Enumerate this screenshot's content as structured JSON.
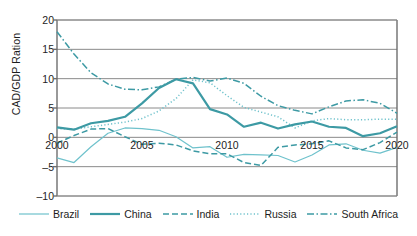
{
  "chart_data": {
    "type": "line",
    "title": "",
    "xlabel": "",
    "ylabel": "CAD/GDP Ration",
    "ylim": [
      -10,
      20
    ],
    "xlim": [
      2000,
      2020
    ],
    "yticks": [
      20,
      15,
      10,
      5,
      0,
      -5,
      -10
    ],
    "ytick_labels": [
      "20",
      "15",
      "10",
      "5",
      "0",
      "–5",
      "–10"
    ],
    "xticks": [
      2000,
      2005,
      2010,
      2015,
      2020
    ],
    "xtick_labels": [
      "2000",
      "2005",
      "2010",
      "2015",
      "2020"
    ],
    "grid": "horizontal",
    "legend_position": "bottom",
    "x": [
      2000,
      2001,
      2002,
      2003,
      2004,
      2005,
      2006,
      2007,
      2008,
      2009,
      2010,
      2011,
      2012,
      2013,
      2014,
      2015,
      2016,
      2017,
      2018,
      2019,
      2020
    ],
    "series": [
      {
        "name": "Brazil",
        "style": "solid-thin",
        "color": "#6fc2cc",
        "values": [
          -3.5,
          -4.3,
          -1.6,
          0.7,
          1.6,
          1.5,
          1.2,
          0.1,
          -1.8,
          -1.6,
          -3.4,
          -2.9,
          -3.0,
          -3.1,
          -4.2,
          -3.0,
          -1.3,
          -1.1,
          -2.2,
          -2.7,
          -1.7
        ]
      },
      {
        "name": "China",
        "style": "solid-thick",
        "color": "#3d9aa4",
        "values": [
          1.7,
          1.3,
          2.4,
          2.8,
          3.5,
          5.8,
          8.4,
          9.9,
          9.2,
          4.8,
          3.9,
          1.8,
          2.5,
          1.5,
          2.2,
          2.7,
          1.8,
          1.6,
          0.2,
          0.7,
          1.9
        ]
      },
      {
        "name": "India",
        "style": "dashed",
        "color": "#3d9aa4",
        "values": [
          -1.0,
          0.3,
          1.4,
          1.5,
          0.1,
          -1.2,
          -1.0,
          -1.3,
          -2.3,
          -2.8,
          -2.8,
          -4.3,
          -4.8,
          -1.7,
          -1.3,
          -1.1,
          -0.6,
          -1.8,
          -2.1,
          -0.9,
          0.9
        ]
      },
      {
        "name": "Russia",
        "style": "dotted",
        "color": "#6fc2cc",
        "values": [
          1.5,
          1.4,
          1.8,
          2.2,
          2.6,
          3.2,
          4.5,
          6.6,
          9.8,
          9.3,
          7.1,
          5.1,
          4.3,
          3.5,
          1.6,
          2.8,
          3.2,
          3.0,
          3.0,
          3.1,
          3.1
        ]
      },
      {
        "name": "South Africa",
        "style": "dash-dot",
        "color": "#3d9aa4",
        "values": [
          18.0,
          14.2,
          11.0,
          9.1,
          8.2,
          8.1,
          8.6,
          9.9,
          10.2,
          9.6,
          10.1,
          9.2,
          7.0,
          5.4,
          4.6,
          4.0,
          5.2,
          6.2,
          6.4,
          5.8,
          4.1
        ]
      }
    ]
  },
  "legend": {
    "items": [
      {
        "label": "Brazil"
      },
      {
        "label": "China"
      },
      {
        "label": "India"
      },
      {
        "label": "Russia"
      },
      {
        "label": "South Africa"
      }
    ]
  }
}
